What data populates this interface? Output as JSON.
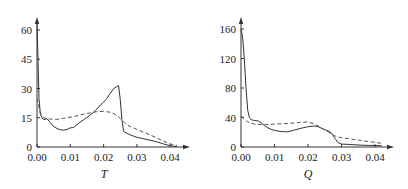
{
  "chart_data": [
    {
      "type": "line",
      "title": "",
      "xlabel": "T",
      "ylabel": "",
      "xlim": [
        0,
        0.044
      ],
      "ylim": [
        0,
        64
      ],
      "grid": false,
      "legend": null,
      "x_ticks": [
        "0.00",
        "0.01",
        "0.02",
        "0.03",
        "0.04"
      ],
      "y_ticks": [
        "0",
        "15",
        "30",
        "45",
        "60"
      ],
      "series": [
        {
          "name": "solid",
          "style": "solid",
          "x": [
            0.0,
            0.0003,
            0.0006,
            0.001,
            0.0015,
            0.002,
            0.003,
            0.004,
            0.005,
            0.006,
            0.007,
            0.008,
            0.009,
            0.01,
            0.011,
            0.012,
            0.013,
            0.014,
            0.015,
            0.016,
            0.017,
            0.018,
            0.019,
            0.02,
            0.021,
            0.022,
            0.023,
            0.024,
            0.0245,
            0.025,
            0.0255,
            0.026,
            0.027,
            0.028,
            0.029,
            0.03,
            0.031,
            0.032,
            0.033,
            0.034,
            0.035,
            0.036,
            0.037,
            0.038,
            0.039,
            0.04,
            0.041,
            0.042
          ],
          "y": [
            63,
            45,
            25,
            17,
            15,
            14,
            14.5,
            12.5,
            10.5,
            9.5,
            8.8,
            8.6,
            9,
            9.8,
            10,
            11.5,
            12.8,
            14,
            15.2,
            16.5,
            17.8,
            19.5,
            21.5,
            23,
            25,
            27.5,
            30,
            31,
            31.5,
            24,
            14,
            8,
            7,
            6.2,
            5.6,
            5,
            4.6,
            4.2,
            3.8,
            3.5,
            3.1,
            2.6,
            2.1,
            1.6,
            1.1,
            0.7,
            0.4,
            0.2
          ]
        },
        {
          "name": "dashed",
          "style": "dashed",
          "x": [
            0.0,
            0.0005,
            0.001,
            0.0015,
            0.002,
            0.004,
            0.006,
            0.008,
            0.01,
            0.012,
            0.014,
            0.016,
            0.018,
            0.02,
            0.022,
            0.024,
            0.025,
            0.026,
            0.027,
            0.028,
            0.03,
            0.032,
            0.034,
            0.036,
            0.038,
            0.04,
            0.042
          ],
          "y": [
            25,
            21,
            17.5,
            16,
            15,
            14.3,
            14.2,
            14.7,
            15.3,
            16,
            16.8,
            17.5,
            18.1,
            18.3,
            17.8,
            16.3,
            14.6,
            12.8,
            11.5,
            10.5,
            9,
            7.6,
            6.2,
            4.6,
            3,
            1.6,
            0.8
          ]
        }
      ]
    },
    {
      "type": "line",
      "title": "",
      "xlabel": "Q",
      "ylabel": "",
      "xlim": [
        0,
        0.044
      ],
      "ylim": [
        0,
        170
      ],
      "grid": false,
      "legend": null,
      "x_ticks": [
        "0.00",
        "0.01",
        "0.02",
        "0.03",
        "0.04"
      ],
      "y_ticks": [
        "0",
        "40",
        "80",
        "120",
        "160"
      ],
      "series": [
        {
          "name": "solid",
          "style": "solid",
          "x": [
            0.0,
            0.0005,
            0.001,
            0.0015,
            0.002,
            0.0025,
            0.003,
            0.004,
            0.005,
            0.006,
            0.007,
            0.008,
            0.009,
            0.01,
            0.012,
            0.014,
            0.016,
            0.018,
            0.02,
            0.022,
            0.023,
            0.024,
            0.025,
            0.026,
            0.027,
            0.028,
            0.029,
            0.03,
            0.032,
            0.034,
            0.036,
            0.038,
            0.04,
            0.042
          ],
          "y": [
            160,
            148,
            120,
            80,
            50,
            40,
            37,
            36,
            35.5,
            33,
            29,
            26,
            24,
            22.5,
            21,
            20.5,
            23,
            25.5,
            27.5,
            28.5,
            27.5,
            25.5,
            23.5,
            22,
            19,
            12,
            6,
            4,
            3.5,
            3,
            2.5,
            2.2,
            2,
            1.8
          ]
        },
        {
          "name": "dashed",
          "style": "dashed",
          "x": [
            0.0,
            0.001,
            0.002,
            0.004,
            0.006,
            0.008,
            0.01,
            0.012,
            0.014,
            0.016,
            0.018,
            0.02,
            0.022,
            0.024,
            0.026,
            0.028,
            0.03,
            0.032,
            0.034,
            0.036,
            0.038,
            0.04,
            0.042
          ],
          "y": [
            42,
            38,
            34,
            31,
            30.5,
            30.5,
            31,
            31.5,
            32,
            32.5,
            33.5,
            34,
            31,
            26,
            20.5,
            15,
            12.5,
            11.2,
            10,
            8.8,
            7.5,
            6.2,
            5
          ]
        }
      ]
    }
  ]
}
